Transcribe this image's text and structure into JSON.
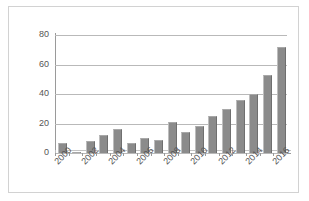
{
  "chart_data": {
    "type": "bar",
    "title": "",
    "xlabel": "",
    "ylabel": "",
    "categories": [
      "2000",
      "2001",
      "2002",
      "2003",
      "2004",
      "2005",
      "2006",
      "2007",
      "2008",
      "2009",
      "2010",
      "2011",
      "2012",
      "2013",
      "2014",
      "2015",
      "2016"
    ],
    "values": [
      7,
      1,
      8,
      12,
      16,
      7,
      10,
      9,
      21,
      14,
      18,
      25,
      30,
      36,
      40,
      53,
      72
    ],
    "ylim": [
      0,
      80
    ],
    "yticks": [
      0,
      20,
      40,
      60,
      80
    ],
    "ytick_labels": [
      "0",
      "20",
      "40",
      "60",
      "80"
    ],
    "xtick_labels": [
      "2000",
      "2002",
      "2004",
      "2006",
      "2008",
      "2010",
      "2012",
      "2014",
      "2016"
    ],
    "grid": true,
    "legend": false,
    "legend_position": "none",
    "bar_color": "#8b8b8b",
    "grid_color": "#b9b9b9",
    "axis_color": "#9a9a9a",
    "border_color": "#d2d2d2",
    "background": "#ffffff"
  }
}
